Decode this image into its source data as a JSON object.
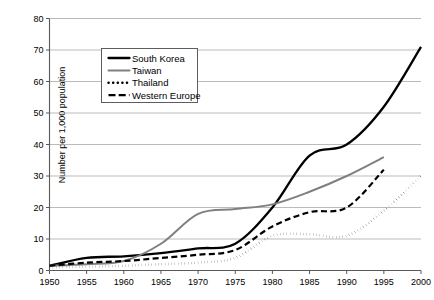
{
  "chart_data": {
    "type": "line",
    "title": "",
    "xlabel": "",
    "ylabel": "Number per 1,000 population",
    "xlim": [
      1950,
      2000
    ],
    "ylim": [
      0,
      80
    ],
    "yticks": [
      0,
      10,
      20,
      30,
      40,
      50,
      60,
      70,
      80
    ],
    "xticks": [
      1950,
      1955,
      1960,
      1965,
      1970,
      1975,
      1980,
      1985,
      1990,
      1995,
      2000
    ],
    "grid": "horizontal",
    "legend_position": "upper-left-inside",
    "series": [
      {
        "name": "South Korea",
        "style": "solid-thick",
        "color": "#000000",
        "x": [
          1950,
          1955,
          1960,
          1965,
          1970,
          1975,
          1980,
          1985,
          1990,
          1995,
          2000
        ],
        "values": [
          1.5,
          4.0,
          4.5,
          5.5,
          7.0,
          8.5,
          20.0,
          36.5,
          40.0,
          52.0,
          71.0
        ]
      },
      {
        "name": "Taiwan",
        "style": "solid",
        "color": "#808080",
        "x": [
          1950,
          1955,
          1960,
          1965,
          1970,
          1975,
          1980,
          1985,
          1990,
          1995
        ],
        "values": [
          1.5,
          2.0,
          3.0,
          8.5,
          18.0,
          19.5,
          21.0,
          25.0,
          30.0,
          36.0
        ]
      },
      {
        "name": "Thailand",
        "style": "dotted",
        "color": "#000000",
        "x": [
          1950,
          1955,
          1960,
          1965,
          1970,
          1975,
          1980,
          1985,
          1990,
          1995,
          2000
        ],
        "values": [
          1.0,
          1.2,
          1.5,
          2.0,
          2.5,
          4.0,
          11.0,
          11.5,
          11.0,
          19.0,
          30.0
        ]
      },
      {
        "name": "Western Europe",
        "style": "dashed",
        "color": "#000000",
        "x": [
          1950,
          1955,
          1960,
          1965,
          1970,
          1975,
          1980,
          1985,
          1990,
          1995
        ],
        "values": [
          1.5,
          2.5,
          3.0,
          4.0,
          5.0,
          6.5,
          14.0,
          18.5,
          20.0,
          32.0
        ]
      }
    ]
  },
  "legend": {
    "items": [
      {
        "label": "South Korea"
      },
      {
        "label": "Taiwan"
      },
      {
        "label": "Thailand"
      },
      {
        "label": "Western Europe"
      }
    ]
  }
}
